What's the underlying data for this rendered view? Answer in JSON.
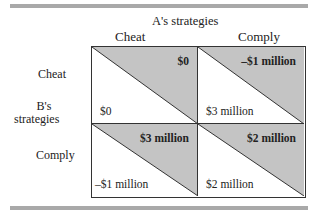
{
  "title": "A's strategies",
  "column_headers": [
    "Cheat",
    "Comply"
  ],
  "row_title_line1": "B's",
  "row_title_line2": "strategies",
  "row_headers": [
    "Cheat",
    "Comply"
  ],
  "colors": {
    "shade": "#c4c4c4",
    "border": "#333333",
    "rule": "#a9a9a9"
  },
  "cells": [
    {
      "row": "Cheat",
      "col": "Cheat",
      "a_payoff": "$0",
      "b_payoff": "$0"
    },
    {
      "row": "Cheat",
      "col": "Comply",
      "a_payoff": "–$1 million",
      "b_payoff": "$3 million"
    },
    {
      "row": "Comply",
      "col": "Cheat",
      "a_payoff": "$3 million",
      "b_payoff": "–$1 million"
    },
    {
      "row": "Comply",
      "col": "Comply",
      "a_payoff": "$2 million",
      "b_payoff": "$2 million"
    }
  ]
}
